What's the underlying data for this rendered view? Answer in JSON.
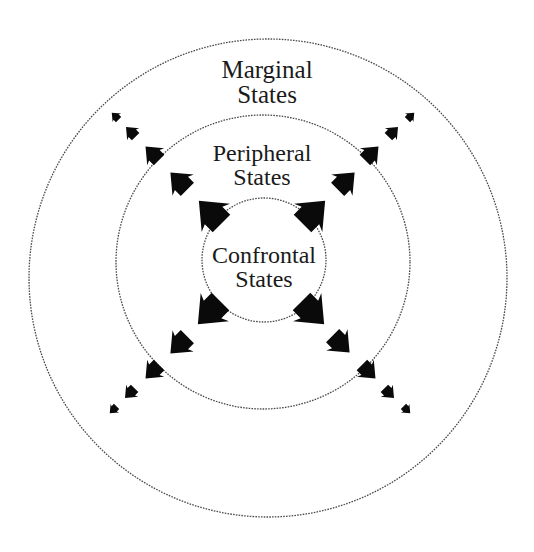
{
  "diagram": {
    "rings": [
      {
        "id": "marginal",
        "cx": 268,
        "cy": 278,
        "r": 239
      },
      {
        "id": "peripheral",
        "cx": 263,
        "cy": 262,
        "r": 147
      },
      {
        "id": "confrontal",
        "cx": 264,
        "cy": 260,
        "r": 62
      }
    ],
    "labels": {
      "marginal": {
        "line1": "Marginal",
        "line2": "States"
      },
      "peripheral": {
        "line1": "Peripheral",
        "line2": "States"
      },
      "confrontal": {
        "line1": "Confrontal",
        "line2": "States"
      }
    },
    "arrow_diagonals": [
      {
        "direction": "north-west",
        "angle": -135,
        "arrows": [
          {
            "x": 213,
            "y": 215,
            "size": 40
          },
          {
            "x": 181,
            "y": 183,
            "size": 30
          },
          {
            "x": 154,
            "y": 155,
            "size": 24
          },
          {
            "x": 132,
            "y": 133,
            "size": 17
          },
          {
            "x": 116,
            "y": 117,
            "size": 12
          }
        ]
      },
      {
        "direction": "north-east",
        "angle": -45,
        "arrows": [
          {
            "x": 311,
            "y": 215,
            "size": 40
          },
          {
            "x": 344,
            "y": 183,
            "size": 30
          },
          {
            "x": 370,
            "y": 155,
            "size": 24
          },
          {
            "x": 392,
            "y": 133,
            "size": 17
          },
          {
            "x": 410,
            "y": 117,
            "size": 12
          }
        ]
      },
      {
        "direction": "south-west",
        "angle": 135,
        "arrows": [
          {
            "x": 212,
            "y": 310,
            "size": 40
          },
          {
            "x": 181,
            "y": 343,
            "size": 30
          },
          {
            "x": 154,
            "y": 370,
            "size": 24
          },
          {
            "x": 131,
            "y": 392,
            "size": 17
          },
          {
            "x": 114,
            "y": 409,
            "size": 12
          }
        ]
      },
      {
        "direction": "south-east",
        "angle": 45,
        "arrows": [
          {
            "x": 310,
            "y": 310,
            "size": 40
          },
          {
            "x": 339,
            "y": 342,
            "size": 30
          },
          {
            "x": 367,
            "y": 370,
            "size": 24
          },
          {
            "x": 388,
            "y": 392,
            "size": 17
          },
          {
            "x": 406,
            "y": 409,
            "size": 12
          }
        ]
      }
    ],
    "colors": {
      "arrow": "#0a0a0a",
      "ring": "#4a4a4a",
      "text": "#1a1a1a",
      "background": "#ffffff"
    }
  }
}
